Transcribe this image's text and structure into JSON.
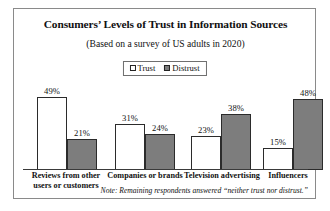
{
  "chart_data": {
    "type": "bar",
    "title": "Consumers’ Levels of Trust in Information Sources",
    "subtitle": "(Based on a survey of US adults in 2020)",
    "xlabel": "",
    "ylabel": "",
    "ylim": [
      0,
      60
    ],
    "grid": false,
    "legend_position": "top-center",
    "categories": [
      "Reviews from other\nusers or customers",
      "Companies or brands",
      "Television advertising",
      "Influencers"
    ],
    "series": [
      {
        "name": "Trust",
        "values": [
          49,
          31,
          23,
          15
        ],
        "color": "#ffffff"
      },
      {
        "name": "Distrust",
        "values": [
          21,
          24,
          38,
          48
        ],
        "color": "#7d7d7d"
      }
    ],
    "value_labels": [
      [
        "49%",
        "31%",
        "23%",
        "15%"
      ],
      [
        "21%",
        "24%",
        "38%",
        "48%"
      ]
    ],
    "note": "Note: Remaining respondents answered “neither trust nor distrust.”"
  },
  "legend": {
    "trust_label": "Trust",
    "distrust_label": "Distrust"
  }
}
